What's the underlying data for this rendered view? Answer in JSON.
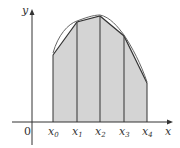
{
  "diagram": {
    "axes": {
      "x_label": "x",
      "y_label": "y",
      "origin_label": "0"
    },
    "partition_labels": [
      {
        "base": "x",
        "sub": "0"
      },
      {
        "base": "x",
        "sub": "1"
      },
      {
        "base": "x",
        "sub": "2"
      },
      {
        "base": "x",
        "sub": "3"
      },
      {
        "base": "x",
        "sub": "4"
      }
    ],
    "colors": {
      "fill": "#d4d4d4",
      "stroke": "#333333",
      "curve": "#555555",
      "background": "#ffffff"
    }
  }
}
